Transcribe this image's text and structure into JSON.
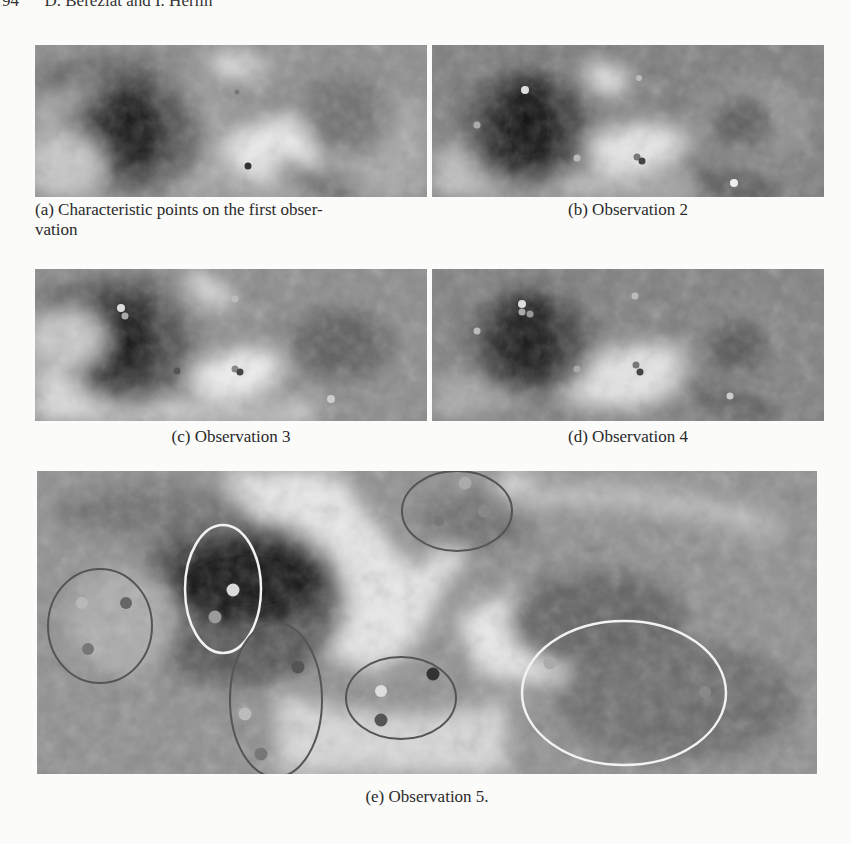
{
  "header": {
    "page_number": "94",
    "authors": "D. Béréziat and I. Herlin"
  },
  "figure": {
    "panels": [
      {
        "id": "a",
        "caption": "(a) Characteristic points on the first obser-",
        "caption_line2": "vation"
      },
      {
        "id": "b",
        "caption": "(b) Observation 2"
      },
      {
        "id": "c",
        "caption": "(c) Observation 3"
      },
      {
        "id": "d",
        "caption": "(d) Observation 4"
      },
      {
        "id": "e",
        "caption": "(e) Observation 5."
      }
    ]
  }
}
